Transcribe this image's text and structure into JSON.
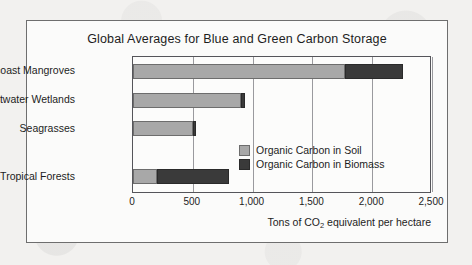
{
  "chart_data": {
    "type": "bar",
    "orientation": "horizontal",
    "stacked": true,
    "title": "Global Averages for Blue and Green Carbon Storage",
    "xlabel": "Tons of CO2 equivalent per hectare",
    "xlabel_prefix": "Tons of CO",
    "xlabel_sub": "2",
    "xlabel_suffix": " equivalent per hectare",
    "ylabel": "",
    "categories": [
      "Seacoast Mangroves",
      "Saltwater Wetlands",
      "Seagrasses",
      "Tropical Forests"
    ],
    "series": [
      {
        "name": "Organic Carbon in Soil",
        "color": "#a8a8a8",
        "values": [
          1770,
          900,
          500,
          200
        ]
      },
      {
        "name": "Organic Carbon in Biomass",
        "color": "#3a3a3a",
        "values": [
          490,
          35,
          25,
          600
        ]
      }
    ],
    "totals": [
      2260,
      935,
      525,
      800
    ],
    "xlim": [
      0,
      2500
    ],
    "xticks": [
      0,
      500,
      1000,
      1500,
      2000,
      2500
    ],
    "xtick_labels": [
      "0",
      "500",
      "1,000",
      "1,500",
      "2,000",
      "2,500"
    ],
    "grid": true,
    "grid_axis": "x",
    "legend_position": "inside-right"
  },
  "legend": {
    "items": [
      {
        "label": "Organic Carbon in Soil",
        "color": "#a8a8a8"
      },
      {
        "label": "Organic Carbon in Biomass",
        "color": "#3a3a3a"
      }
    ]
  }
}
